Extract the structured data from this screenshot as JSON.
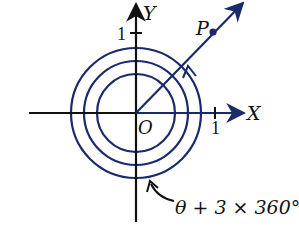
{
  "diagram": {
    "type": "polar-angle-rotation",
    "axes": {
      "x_label": "X",
      "y_label": "Y",
      "origin_label": "O",
      "x_tick_label": "1",
      "y_tick_label": "1"
    },
    "point": {
      "label": "P"
    },
    "annotation": "θ + 3 × 360°",
    "circles": 3,
    "colors": {
      "curve": "#1a2a6c",
      "axis": "#111111",
      "background": "#ffffff"
    }
  }
}
